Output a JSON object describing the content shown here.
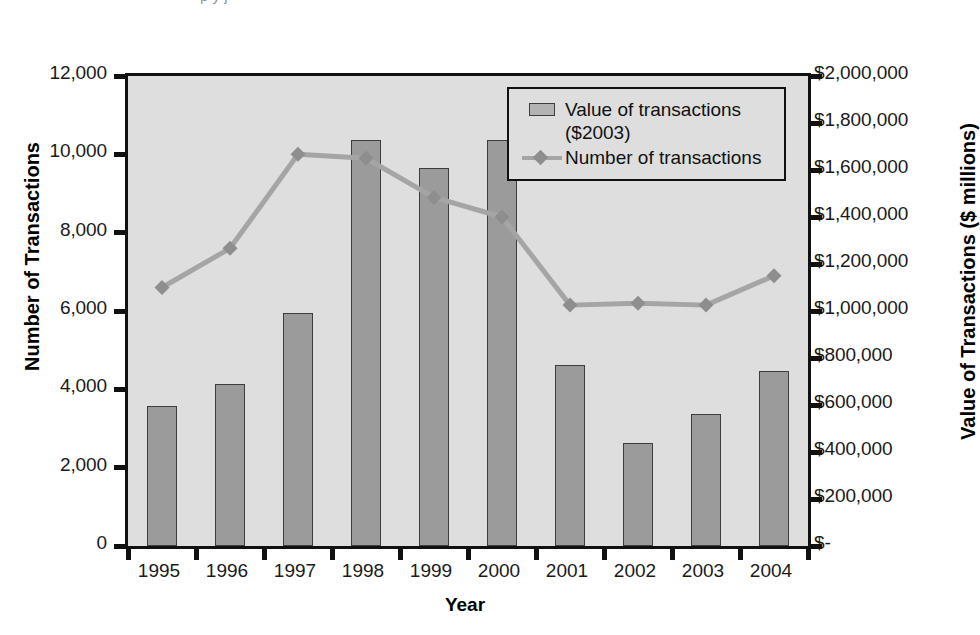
{
  "top_fragment": {
    "text": "p        y                                    j"
  },
  "axes": {
    "left_title": "Number of Transactions",
    "right_title": "Value of Transactions ($ millions)",
    "x_title": "Year",
    "left_ticks": [
      "12,000",
      "10,000",
      "8,000",
      "6,000",
      "4,000",
      "2,000",
      "0"
    ],
    "right_ticks": [
      "$2,000,000",
      "$1,800,000",
      "$1,600,000",
      "$1,400,000",
      "$1,200,000",
      "$1,000,000",
      "$800,000",
      "$600,000",
      "$400,000",
      "$200,000",
      "$-"
    ]
  },
  "legend": {
    "bar_label": "Value of transactions",
    "bar_label_line2": "($2003)",
    "line_label": "Number of transactions"
  },
  "colors": {
    "bar_fill": "#9b9b9b",
    "bar_edge": "#3d3d3d",
    "line": "#a5a5a5",
    "marker": "#8e8e8e",
    "plot_bg": "#dedede",
    "frame": "#111111"
  },
  "chart_data": {
    "type": "bar",
    "title": "",
    "xlabel": "Year",
    "ylabel": "Number of Transactions",
    "y2label": "Value of Transactions ($ millions)",
    "categories": [
      "1995",
      "1996",
      "1997",
      "1998",
      "1999",
      "2000",
      "2001",
      "2002",
      "2003",
      "2004"
    ],
    "ylim": [
      0,
      12000
    ],
    "y2lim": [
      0,
      2000000
    ],
    "grid": false,
    "legend_position": "top-right-inside",
    "series": [
      {
        "name": "Value of transactions ($2003)",
        "type": "bar",
        "axis": "right",
        "unit": "$ millions",
        "values": [
          595000,
          690000,
          991000,
          1727000,
          1608000,
          1727000,
          770000,
          438000,
          561000,
          745000
        ]
      },
      {
        "name": "Number of transactions",
        "type": "line",
        "axis": "left",
        "marker": "diamond",
        "values": [
          6600,
          7600,
          10000,
          9900,
          8900,
          8400,
          6150,
          6200,
          6150,
          6900
        ]
      }
    ]
  }
}
